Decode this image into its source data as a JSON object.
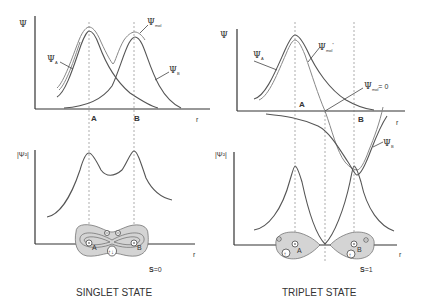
{
  "singlet": {
    "title": "SINGLET STATE",
    "spin_label": "S",
    "spin_value": "=0",
    "top_panel": {
      "y_label": "Ψ",
      "x_label": "r",
      "nucleus_a": "A",
      "nucleus_b": "B",
      "curve_labels": {
        "psi_a": "Ψ",
        "psi_a_sub": "A",
        "psi_b": "Ψ",
        "psi_b_sub": "B",
        "psi_mol": "Ψ",
        "psi_mol_sub": "mol"
      }
    },
    "bottom_panel": {
      "y_label": "|Ψ²|",
      "x_label": "r",
      "nucleus_a": "A",
      "nucleus_b": "B",
      "electron_symbol": "⊝",
      "spin_pair": "↑↓"
    }
  },
  "triplet": {
    "title": "TRIPLET STATE",
    "spin_label": "S",
    "spin_value": "=1",
    "top_panel": {
      "y_label": "Ψ",
      "x_label": "r",
      "nucleus_a": "A",
      "nucleus_b": "B",
      "curve_labels": {
        "psi_a": "Ψ",
        "psi_a_sub": "A",
        "psi_b": "Ψ",
        "psi_b_sub": "B",
        "psi_mol": "Ψ",
        "psi_mol_sub": "mol",
        "psi_mol_sup": "*",
        "node_label": "Ψ",
        "node_sub": "mol",
        "node_value": "= 0"
      }
    },
    "bottom_panel": {
      "y_label": "|Ψ²|",
      "x_label": "r",
      "nucleus_a": "A",
      "nucleus_b": "B",
      "electron_symbol": "⊝",
      "spin_up": "↑"
    }
  }
}
